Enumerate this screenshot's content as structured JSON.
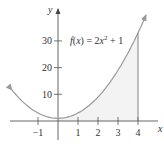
{
  "chart_data": {
    "type": "line",
    "title": "",
    "function_label": "f(x) = 2x² + 1",
    "function_parts": {
      "lhs": "f(x) = 2x",
      "exp": "2",
      "rhs": " + 1"
    },
    "xlabel": "x",
    "ylabel": "y",
    "x_ticks": [
      -1,
      1,
      2,
      3,
      4
    ],
    "x_tick_labels": [
      "−1",
      "1",
      "2",
      "3",
      "4"
    ],
    "y_ticks": [
      10,
      20,
      30
    ],
    "y_tick_labels": [
      "10",
      "20",
      "30"
    ],
    "xlim": [
      -2.9,
      5.1
    ],
    "ylim": [
      -10,
      45
    ],
    "series": [
      {
        "name": "f(x) = 2x^2 + 1",
        "x": [
          -2.3,
          -1,
          0,
          1,
          2,
          3,
          4,
          4.4
        ],
        "y": [
          11.6,
          3,
          1,
          3,
          9,
          19,
          33,
          39.7
        ]
      }
    ],
    "shaded_region": {
      "from_x": 0,
      "to_x": 4,
      "under": "f(x)"
    },
    "vertical_line_x": 4,
    "grid": false,
    "legend": "none"
  }
}
